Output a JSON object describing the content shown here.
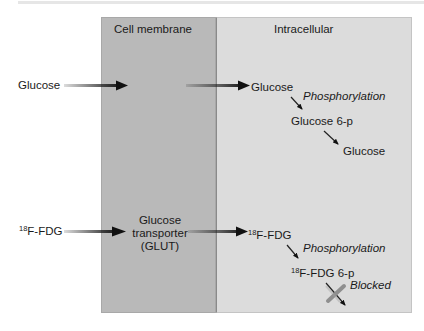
{
  "regions": {
    "membrane": "Cell membrane",
    "intracellular": "Intracellular"
  },
  "glucose_path": {
    "input": "Glucose",
    "product": "Glucose",
    "step1": "Phosphorylation",
    "intermediate": "Glucose 6-p",
    "final": "Glucose"
  },
  "fdg_path": {
    "input_sup": "18",
    "input": "F-FDG",
    "transporter_line1": "Glucose",
    "transporter_line2": "transporter",
    "transporter_line3": "(GLUT)",
    "product_sup": "18",
    "product": "F-FDG",
    "step1": "Phosphorylation",
    "intermediate_sup": "18",
    "intermediate": "F-FDG 6-p",
    "blocked": "Blocked"
  },
  "colors": {
    "membrane_fill": "#b9b9b9",
    "intracellular_fill": "#dcdcdc",
    "blocked_x": "#8f8f8f"
  }
}
